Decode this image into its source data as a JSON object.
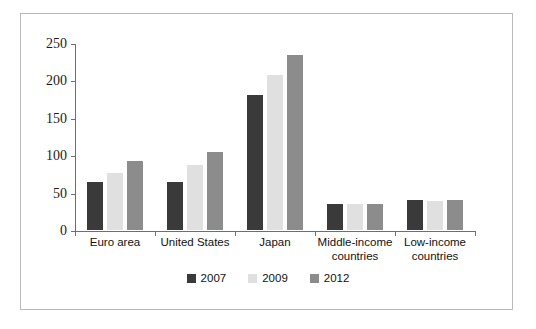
{
  "chart_data": {
    "type": "bar",
    "title": "",
    "subtitle": "",
    "xlabel": "",
    "ylabel": "",
    "ylim": [
      0,
      250
    ],
    "yticks": [
      0,
      50,
      100,
      150,
      200,
      250
    ],
    "ytick_labels": [
      "0",
      "50",
      "100",
      "150",
      "200",
      "250"
    ],
    "grid": false,
    "legend_position": "bottom-center",
    "categories": [
      "Euro area",
      "United States",
      "Japan",
      "Middle-income countries",
      "Low-income countries"
    ],
    "category_labels": [
      "Euro area",
      "United States",
      "Japan",
      "Middle-income\ncountries",
      "Low-income\ncountries"
    ],
    "series": [
      {
        "name": "2007",
        "color": "#3a3a3a",
        "values": [
          67,
          67,
          183,
          37,
          43
        ]
      },
      {
        "name": "2009",
        "color": "#e0e0e0",
        "values": [
          79,
          90,
          210,
          37,
          41
        ]
      },
      {
        "name": "2012",
        "color": "#8c8c8c",
        "values": [
          95,
          107,
          237,
          38,
          43
        ]
      }
    ]
  },
  "legend": {
    "entries": [
      {
        "label": "2007",
        "color": "#3a3a3a"
      },
      {
        "label": "2009",
        "color": "#e0e0e0"
      },
      {
        "label": "2012",
        "color": "#8c8c8c"
      }
    ]
  },
  "colors": {
    "frame_border": "#b9b9b9",
    "axis": "#6e6e6e",
    "background": "#ffffff",
    "text": "#111111",
    "bar_outline": "#ffffff"
  }
}
